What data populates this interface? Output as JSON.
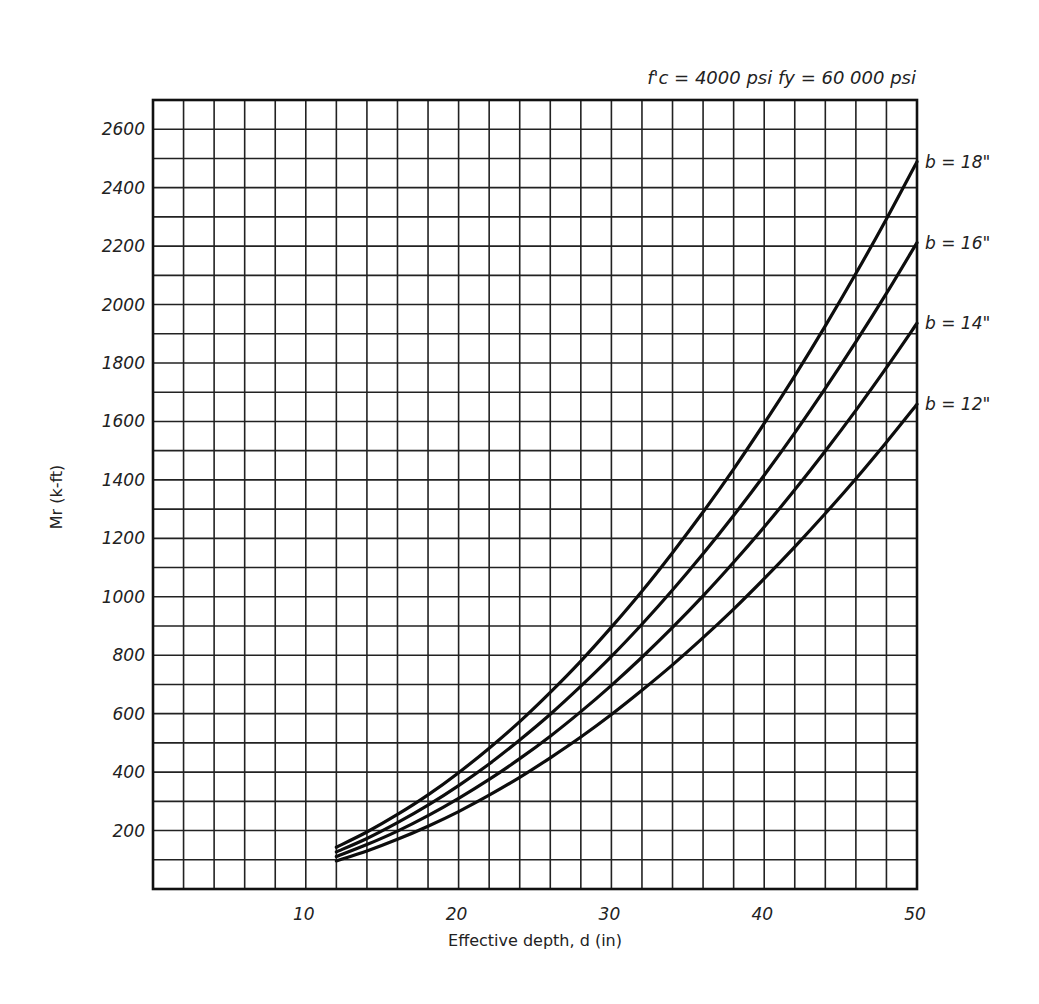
{
  "chart_data": {
    "type": "line",
    "title": "",
    "annotation": "f'c = 4000 psi   fy = 60 000 psi",
    "xlabel": "Effective depth, d (in)",
    "ylabel": "Mr (k-ft)",
    "xlim": [
      0,
      50
    ],
    "ylim": [
      0,
      2700
    ],
    "x_ticks": [
      10,
      20,
      30,
      40,
      50
    ],
    "y_ticks": [
      200,
      400,
      600,
      800,
      1000,
      1200,
      1400,
      1600,
      1800,
      2000,
      2200,
      2400,
      2600
    ],
    "grid": true,
    "grid_x_step": 2,
    "grid_y_step": 100,
    "legend_position": "inline-right",
    "x": [
      12,
      14,
      16,
      18,
      20,
      22,
      24,
      26,
      28,
      30,
      32,
      34,
      36,
      38,
      40,
      42,
      44,
      46,
      48,
      50
    ],
    "series": [
      {
        "name": "b = 18\"",
        "b": 18,
        "values": [
          143,
          195,
          255,
          322,
          398,
          482,
          573,
          673,
          780,
          896,
          1019,
          1151,
          1290,
          1437,
          1593,
          1756,
          1927,
          2106,
          2293,
          2489
        ]
      },
      {
        "name": "b = 16\"",
        "b": 16,
        "values": [
          127,
          173,
          227,
          287,
          354,
          428,
          510,
          598,
          694,
          796,
          906,
          1023,
          1147,
          1278,
          1416,
          1561,
          1713,
          1872,
          2038,
          2212
        ]
      },
      {
        "name": "b = 14\"",
        "b": 14,
        "values": [
          111,
          152,
          198,
          251,
          310,
          375,
          446,
          523,
          607,
          697,
          793,
          895,
          1003,
          1118,
          1239,
          1366,
          1499,
          1638,
          1784,
          1936
        ]
      },
      {
        "name": "b = 12\"",
        "b": 12,
        "values": [
          96,
          130,
          170,
          215,
          265,
          321,
          382,
          449,
          520,
          597,
          680,
          767,
          860,
          958,
          1062,
          1171,
          1285,
          1404,
          1529,
          1659
        ]
      }
    ]
  },
  "labels": {
    "params": "f'c = 4000 psi   fy = 60 000 psi",
    "xlabel": "Effective depth, d (in)",
    "ylabel": "Mr (k-ft)"
  }
}
